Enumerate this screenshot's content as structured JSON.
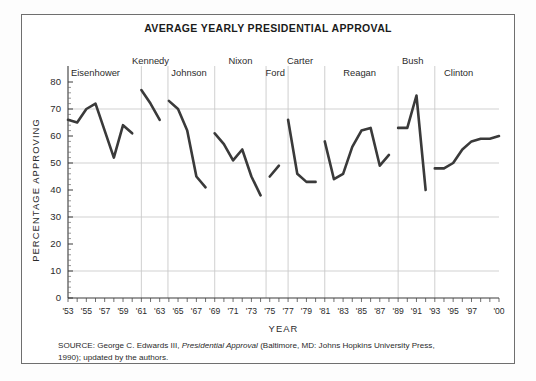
{
  "figure": {
    "title": "AVERAGE YEARLY PRESIDENTIAL APPROVAL",
    "source_line1": "SOURCE: George C. Edwards III, ",
    "source_italic": "Presidential Approval",
    "source_line1b": " (Baltimore, MD: Johns Hopkins University Press,",
    "source_line2": "1990); updated by the authors."
  },
  "chart_data": {
    "type": "line",
    "title": "AVERAGE YEARLY PRESIDENTIAL APPROVAL",
    "xlabel": "YEAR",
    "ylabel": "PERCENTAGE APPROVING",
    "ylim": [
      0,
      80
    ],
    "xlim": [
      1953,
      2000
    ],
    "grid": "horizontal-and-president-dividers",
    "legend": "none",
    "yticks": [
      0,
      10,
      20,
      30,
      40,
      50,
      60,
      70,
      80
    ],
    "ytick_labels": [
      "0",
      "10",
      "20",
      "30",
      "40",
      "50",
      "60",
      "70",
      "80"
    ],
    "xticks": [
      1953,
      1955,
      1957,
      1959,
      1961,
      1963,
      1965,
      1967,
      1969,
      1971,
      1973,
      1975,
      1977,
      1979,
      1981,
      1983,
      1985,
      1987,
      1989,
      1991,
      1993,
      1995,
      1997,
      2000
    ],
    "xtick_labels": [
      "'53",
      "'55",
      "'57",
      "'59",
      "'61",
      "'63",
      "'65",
      "'67",
      "'69",
      "'71",
      "'73",
      "'75",
      "'77",
      "'79",
      "'81",
      "'83",
      "'85",
      "'87",
      "'89",
      "'91",
      "'93",
      "'95",
      "'97",
      "'00"
    ],
    "minor_xticks_every": 1,
    "line_color": "#3a3a3a",
    "gridline_color": "#cccccc",
    "annotations": [
      {
        "label": "Eisenhower",
        "x": 1956.0,
        "y_label_row": "lower"
      },
      {
        "label": "Kennedy",
        "x": 1962.0,
        "y_label_row": "upper"
      },
      {
        "label": "Johnson",
        "x": 1966.2,
        "y_label_row": "lower"
      },
      {
        "label": "Nixon",
        "x": 1971.8,
        "y_label_row": "upper"
      },
      {
        "label": "Ford",
        "x": 1975.6,
        "y_label_row": "lower"
      },
      {
        "label": "Carter",
        "x": 1978.3,
        "y_label_row": "upper"
      },
      {
        "label": "Reagan",
        "x": 1984.8,
        "y_label_row": "lower"
      },
      {
        "label": "Bush",
        "x": 1990.6,
        "y_label_row": "upper"
      },
      {
        "label": "Clinton",
        "x": 1995.6,
        "y_label_row": "lower"
      }
    ],
    "president_dividers": [
      1961.0,
      1963.9,
      1969.0,
      1974.6,
      1977.0,
      1981.0,
      1989.0,
      1993.0
    ],
    "series": [
      {
        "name": "Average yearly presidential approval",
        "x": [
          1953,
          1954,
          1955,
          1956,
          1957,
          1958,
          1959,
          1960,
          1961,
          1962,
          1963,
          1964,
          1965,
          1966,
          1967,
          1968,
          1969,
          1970,
          1971,
          1972,
          1973,
          1974,
          1975,
          1976,
          1977,
          1978,
          1979,
          1980,
          1981,
          1982,
          1983,
          1984,
          1985,
          1986,
          1987,
          1988,
          1989,
          1990,
          1991,
          1992,
          1993,
          1994,
          1995,
          1996,
          1997,
          1998,
          1999,
          2000
        ],
        "values": [
          66,
          65,
          70,
          72,
          62,
          52,
          64,
          61,
          77,
          72,
          66,
          73,
          70,
          62,
          45,
          41,
          61,
          57,
          51,
          55,
          45,
          38,
          45,
          49,
          66,
          46,
          43,
          43,
          58,
          44,
          46,
          56,
          62,
          63,
          49,
          53,
          63,
          63,
          75,
          40,
          48,
          48,
          50,
          55,
          58,
          59,
          59,
          60
        ],
        "segments": [
          {
            "president": "Eisenhower",
            "x": [
              1953,
              1954,
              1955,
              1956,
              1957,
              1958,
              1959,
              1960
            ],
            "values": [
              66,
              65,
              70,
              72,
              62,
              52,
              64,
              61
            ]
          },
          {
            "president": "Kennedy",
            "x": [
              1961,
              1962,
              1963
            ],
            "values": [
              77,
              72,
              66
            ]
          },
          {
            "president": "Johnson",
            "x": [
              1964,
              1965,
              1966,
              1967,
              1968
            ],
            "values": [
              73,
              70,
              62,
              45,
              41
            ]
          },
          {
            "president": "Nixon",
            "x": [
              1969,
              1970,
              1971,
              1972,
              1973,
              1974
            ],
            "values": [
              61,
              57,
              51,
              55,
              45,
              38
            ]
          },
          {
            "president": "Ford",
            "x": [
              1975,
              1976
            ],
            "values": [
              45,
              49
            ]
          },
          {
            "president": "Carter",
            "x": [
              1977,
              1978,
              1979,
              1980
            ],
            "values": [
              66,
              46,
              43,
              43
            ]
          },
          {
            "president": "Reagan",
            "x": [
              1981,
              1982,
              1983,
              1984,
              1985,
              1986,
              1987,
              1988
            ],
            "values": [
              58,
              44,
              46,
              56,
              62,
              63,
              49,
              53
            ]
          },
          {
            "president": "Bush",
            "x": [
              1989,
              1990,
              1991,
              1992
            ],
            "values": [
              63,
              63,
              75,
              40
            ]
          },
          {
            "president": "Clinton",
            "x": [
              1993,
              1994,
              1995,
              1996,
              1997,
              1998,
              1999,
              2000
            ],
            "values": [
              48,
              48,
              50,
              55,
              58,
              59,
              59,
              60
            ]
          }
        ]
      }
    ]
  }
}
